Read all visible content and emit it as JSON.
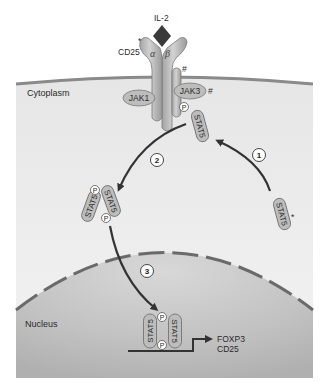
{
  "diagram": {
    "compartments": {
      "cytoplasm": "Cytoplasm",
      "nucleus": "Nucleus"
    },
    "ligand": {
      "label": "IL-2"
    },
    "receptor": {
      "cd25_label": "CD25",
      "cd25_marker": "*",
      "alpha": "α",
      "beta": "β",
      "gamma_marker": "#"
    },
    "kinases": {
      "jak1": "JAK1",
      "jak3": "JAK3",
      "jak3_marker": "#"
    },
    "molecules": {
      "stat5": "STAT5",
      "stat5_marker": "*",
      "phospho": "P"
    },
    "steps": [
      {
        "number": "1",
        "description": "STAT5 recruited to receptor"
      },
      {
        "number": "2",
        "description": "Phosphorylated STAT5 dimerizes"
      },
      {
        "number": "3",
        "description": "Dimer translocates to nucleus"
      }
    ],
    "target_genes": [
      "FOXP3",
      "CD25"
    ],
    "colors": {
      "cytoplasm_fill": "#efefef",
      "membrane": "#8a8a8a",
      "nucleus_fill": "#c4c4c4",
      "nuclear_envelope": "#6a6a6a",
      "protein_fill": "#b9b9b9",
      "ligand": "#3a3a3a",
      "arrow": "#333333"
    }
  }
}
